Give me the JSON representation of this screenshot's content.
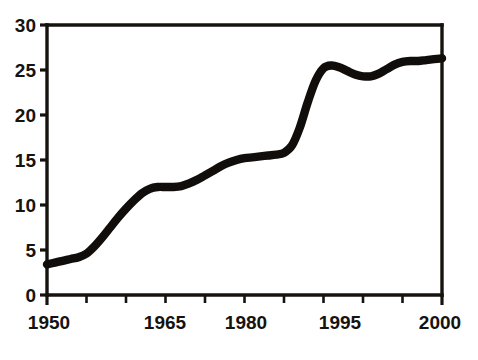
{
  "chart_data": {
    "type": "line",
    "title": "",
    "subtitle": "",
    "xlabel": "",
    "ylabel": "",
    "xlim": [
      1950,
      2000
    ],
    "ylim": [
      0,
      30
    ],
    "grid": false,
    "legend": null,
    "legend_position": "none",
    "line_color": "#100d0b",
    "background_color": "#ffffff",
    "x_tick_labels": [
      "1950",
      "1965",
      "1980",
      "1995",
      "2000"
    ],
    "x_tick_values": [
      1950,
      1965,
      1980,
      1995,
      2000
    ],
    "x_minor_tick_values": [
      1955,
      1960,
      1970,
      1975,
      1985,
      1990
    ],
    "y_tick_labels": [
      "0",
      "5",
      "10",
      "15",
      "20",
      "25",
      "30"
    ],
    "y_tick_values": [
      0,
      5,
      10,
      15,
      20,
      25,
      30
    ],
    "series": [
      {
        "name": "series-1",
        "x": [
          1950,
          1951,
          1952,
          1953,
          1954,
          1955,
          1956,
          1957,
          1958,
          1959,
          1960,
          1961,
          1962,
          1963,
          1964,
          1965,
          1966,
          1967,
          1968,
          1969,
          1970,
          1971,
          1972,
          1973,
          1974,
          1975,
          1976,
          1977,
          1978,
          1979,
          1980,
          1981,
          1982,
          1983,
          1984,
          1985,
          1986,
          1987,
          1988,
          1989,
          1990,
          1991,
          1992,
          1993,
          1994,
          1995,
          1996,
          1997,
          1998,
          1999,
          2000
        ],
        "values": [
          3.4,
          3.6,
          3.8,
          4.0,
          4.2,
          4.6,
          5.4,
          6.4,
          7.5,
          8.6,
          9.6,
          10.5,
          11.3,
          11.8,
          12.0,
          12.0,
          12.0,
          12.1,
          12.4,
          12.8,
          13.3,
          13.8,
          14.3,
          14.7,
          15.0,
          15.2,
          15.3,
          15.4,
          15.5,
          15.6,
          15.8,
          16.6,
          18.6,
          21.4,
          23.8,
          25.2,
          25.5,
          25.3,
          24.9,
          24.5,
          24.3,
          24.3,
          24.6,
          25.1,
          25.6,
          25.9,
          26.0,
          26.0,
          26.1,
          26.2,
          26.3
        ]
      }
    ],
    "annotations": []
  },
  "axes": {
    "y_axis_name": "y-axis",
    "x_axis_name": "x-axis"
  }
}
